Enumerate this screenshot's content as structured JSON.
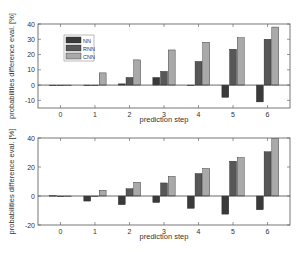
{
  "colors": {
    "NN": "#3a3a3a",
    "RNN": "#575757",
    "CNN": "#a9a9a9"
  },
  "chart_data": [
    {
      "type": "bar",
      "title": "",
      "xlabel": "prediction step",
      "ylabel": "probabilities difference eval. [%]",
      "categories": [
        "0",
        "1",
        "2",
        "3",
        "4",
        "5",
        "6"
      ],
      "ylim": [
        -15,
        40
      ],
      "yticks": [
        -10,
        0,
        10,
        20,
        30,
        40
      ],
      "legend": {
        "position": "upper-left",
        "entries": [
          "NN",
          "RNN",
          "CNN"
        ]
      },
      "grid": false,
      "series": [
        {
          "name": "NN",
          "values": [
            0,
            0,
            0.8,
            5,
            0,
            -8,
            -11
          ]
        },
        {
          "name": "RNN",
          "values": [
            0,
            -0.3,
            5,
            9,
            15.5,
            23.5,
            30
          ]
        },
        {
          "name": "CNN",
          "values": [
            0,
            8,
            16.5,
            23,
            28,
            31,
            38
          ]
        }
      ]
    },
    {
      "type": "bar",
      "title": "",
      "xlabel": "prediction step",
      "ylabel": "probabilities difference eval. [%]",
      "categories": [
        "0",
        "1",
        "2",
        "3",
        "4",
        "5",
        "6"
      ],
      "ylim": [
        -20,
        40
      ],
      "yticks": [
        -20,
        0,
        20,
        40
      ],
      "legend": null,
      "grid": false,
      "series": [
        {
          "name": "NN",
          "values": [
            0.3,
            -3.5,
            -6,
            -4.5,
            -8.5,
            -12.5,
            -9.5
          ]
        },
        {
          "name": "RNN",
          "values": [
            -0.5,
            -0.3,
            5,
            9,
            15.5,
            24,
            30.5
          ]
        },
        {
          "name": "CNN",
          "values": [
            0,
            4,
            9.5,
            13.5,
            19,
            26.5,
            39.5
          ]
        }
      ]
    }
  ]
}
